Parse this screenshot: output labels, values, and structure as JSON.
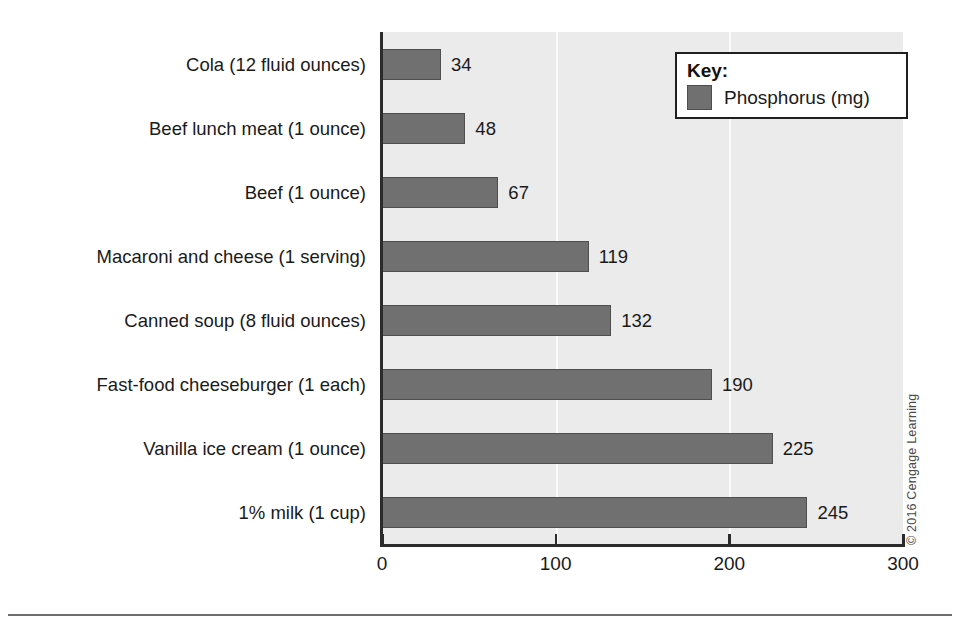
{
  "chart_data": {
    "type": "bar",
    "orientation": "horizontal",
    "title": "",
    "xlabel": "",
    "ylabel": "",
    "xlim": [
      0,
      300
    ],
    "xticks": [
      "0",
      "100",
      "200",
      "300"
    ],
    "gridlines": [
      "100",
      "200"
    ],
    "grid": true,
    "legend_position": "top-right",
    "legend_title": "Key:",
    "series": [
      {
        "name": "Phosphorus (mg)",
        "color": "#707070",
        "values": [
          34,
          48,
          67,
          119,
          132,
          190,
          225,
          245
        ]
      }
    ],
    "categories": [
      "Cola (12 fluid ounces)",
      "Beef lunch meat (1 ounce)",
      "Beef (1 ounce)",
      "Macaroni and cheese (1 serving)",
      "Canned soup (8 fluid ounces)",
      "Fast-food cheeseburger (1 each)",
      "Vanilla ice cream (1 ounce)",
      "1% milk (1 cup)"
    ],
    "data_labels": [
      "34",
      "48",
      "67",
      "119",
      "132",
      "190",
      "225",
      "245"
    ]
  },
  "legend": {
    "title": "Key:",
    "entries": [
      {
        "label": "Phosphorus (mg)",
        "color": "#707070"
      }
    ]
  },
  "credit": "© 2016 Cengage Learning",
  "colors": {
    "bar_fill": "#707070",
    "bar_stroke": "#4e4e4e",
    "plot_background": "#ebebeb",
    "gridline": "#fbfbfb",
    "axis": "#2b2b2b",
    "text": "#1a1a1a",
    "page_background": "#ffffff"
  }
}
